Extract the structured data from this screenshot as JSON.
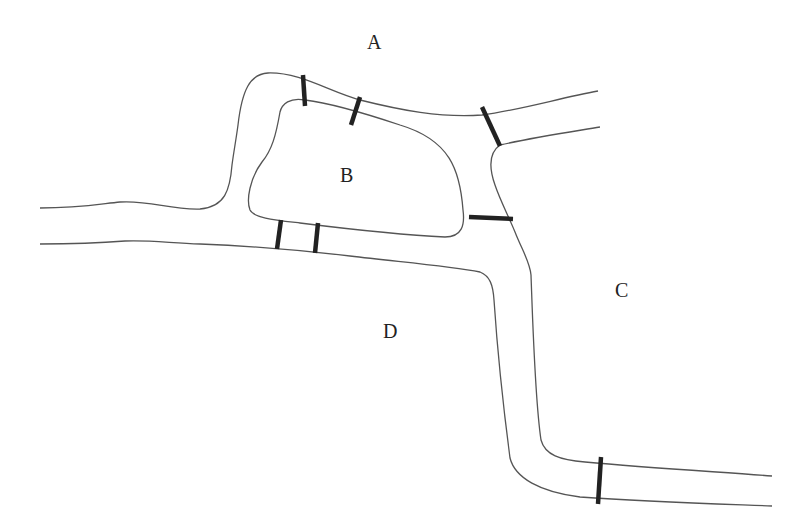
{
  "diagram": {
    "regions": [
      {
        "id": "A",
        "label": "A",
        "x": 376,
        "y": 49
      },
      {
        "id": "B",
        "label": "B",
        "x": 348,
        "y": 182
      },
      {
        "id": "C",
        "label": "C",
        "x": 623,
        "y": 297
      },
      {
        "id": "D",
        "label": "D",
        "x": 391,
        "y": 338
      }
    ],
    "bridges": [
      {
        "id": "b1",
        "connects": [
          "A",
          "B"
        ],
        "x1": 303,
        "y1": 75,
        "x2": 305,
        "y2": 106
      },
      {
        "id": "b2",
        "connects": [
          "A",
          "B"
        ],
        "x1": 360,
        "y1": 97,
        "x2": 351,
        "y2": 125
      },
      {
        "id": "b3",
        "connects": [
          "A",
          "C"
        ],
        "x1": 482,
        "y1": 107,
        "x2": 500,
        "y2": 146
      },
      {
        "id": "b4",
        "connects": [
          "B",
          "C"
        ],
        "x1": 469,
        "y1": 217,
        "x2": 513,
        "y2": 219
      },
      {
        "id": "b5",
        "connects": [
          "B",
          "D"
        ],
        "x1": 281,
        "y1": 220,
        "x2": 277,
        "y2": 249
      },
      {
        "id": "b6",
        "connects": [
          "B",
          "D"
        ],
        "x1": 318,
        "y1": 223,
        "x2": 315,
        "y2": 253
      },
      {
        "id": "b7",
        "connects": [
          "C",
          "D"
        ],
        "x1": 601,
        "y1": 457,
        "x2": 598,
        "y2": 504
      }
    ],
    "colors": {
      "river": "#555555",
      "bridge": "#222222",
      "background": "#ffffff"
    }
  }
}
